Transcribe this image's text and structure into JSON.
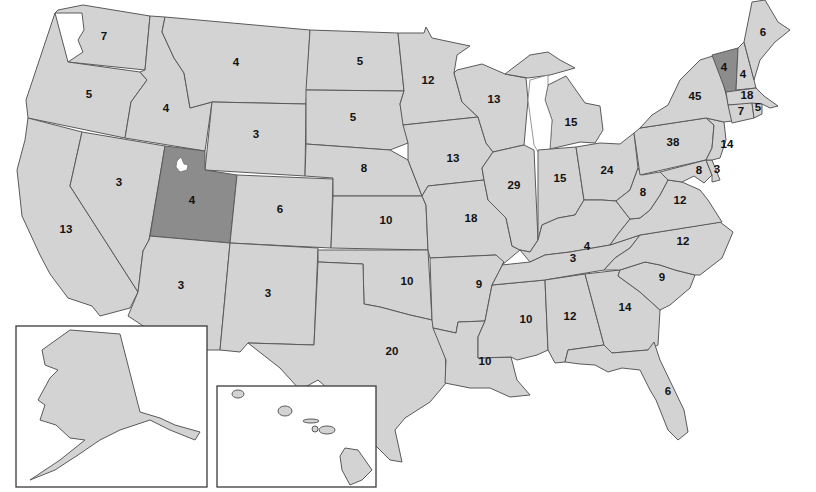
{
  "map": {
    "title": "United States map with state values",
    "colors": {
      "state_fill": "#d3d3d3",
      "highlight_fill": "#8c8c8c",
      "border": "#5a5a5a",
      "background": "#ffffff",
      "label": "#111111"
    },
    "highlighted_states": [
      "Utah",
      "Vermont"
    ],
    "states": [
      {
        "id": "WA",
        "name": "Washington",
        "value": "7",
        "x": 104,
        "y": 37
      },
      {
        "id": "OR",
        "name": "Oregon",
        "value": "5",
        "x": 89,
        "y": 95
      },
      {
        "id": "CA",
        "name": "California",
        "value": "13",
        "x": 66,
        "y": 230
      },
      {
        "id": "ID",
        "name": "Idaho",
        "value": "4",
        "x": 166,
        "y": 109
      },
      {
        "id": "NV",
        "name": "Nevada",
        "value": "3",
        "x": 119,
        "y": 183
      },
      {
        "id": "MT",
        "name": "Montana",
        "value": "4",
        "x": 236,
        "y": 63
      },
      {
        "id": "WY",
        "name": "Wyoming",
        "value": "3",
        "x": 256,
        "y": 135
      },
      {
        "id": "UT",
        "name": "Utah",
        "value": "4",
        "x": 192,
        "y": 201
      },
      {
        "id": "CO",
        "name": "Colorado",
        "value": "6",
        "x": 280,
        "y": 210
      },
      {
        "id": "AZ",
        "name": "Arizona",
        "value": "3",
        "x": 181,
        "y": 286
      },
      {
        "id": "NM",
        "name": "New Mexico",
        "value": "3",
        "x": 268,
        "y": 294
      },
      {
        "id": "ND",
        "name": "North Dakota",
        "value": "5",
        "x": 360,
        "y": 62
      },
      {
        "id": "SD",
        "name": "South Dakota",
        "value": "5",
        "x": 353,
        "y": 118
      },
      {
        "id": "NE",
        "name": "Nebraska",
        "value": "8",
        "x": 364,
        "y": 169
      },
      {
        "id": "KS",
        "name": "Kansas",
        "value": "10",
        "x": 386,
        "y": 221
      },
      {
        "id": "OK",
        "name": "Oklahoma",
        "value": "10",
        "x": 407,
        "y": 282
      },
      {
        "id": "TX",
        "name": "Texas",
        "value": "20",
        "x": 392,
        "y": 352
      },
      {
        "id": "MN",
        "name": "Minnesota",
        "value": "12",
        "x": 428,
        "y": 81
      },
      {
        "id": "IA",
        "name": "Iowa",
        "value": "13",
        "x": 453,
        "y": 159
      },
      {
        "id": "MO",
        "name": "Missouri",
        "value": "18",
        "x": 471,
        "y": 219
      },
      {
        "id": "AR",
        "name": "Arkansas",
        "value": "9",
        "x": 479,
        "y": 285
      },
      {
        "id": "LA",
        "name": "Louisiana",
        "value": "10",
        "x": 485,
        "y": 362
      },
      {
        "id": "WI",
        "name": "Wisconsin",
        "value": "13",
        "x": 494,
        "y": 100
      },
      {
        "id": "IL",
        "name": "Illinois",
        "value": "29",
        "x": 514,
        "y": 186
      },
      {
        "id": "MS",
        "name": "Mississippi",
        "value": "10",
        "x": 526,
        "y": 320
      },
      {
        "id": "MI",
        "name": "Michigan",
        "value": "15",
        "x": 571,
        "y": 123
      },
      {
        "id": "IN",
        "name": "Indiana",
        "value": "15",
        "x": 560,
        "y": 179
      },
      {
        "id": "KY",
        "name": "Kentucky",
        "value": "4",
        "x": 587,
        "y": 247
      },
      {
        "id": "TN",
        "name": "Tennessee",
        "value": "3",
        "x": 573,
        "y": 259
      },
      {
        "id": "AL",
        "name": "Alabama",
        "value": "12",
        "x": 570,
        "y": 317
      },
      {
        "id": "OH",
        "name": "Ohio",
        "value": "24",
        "x": 607,
        "y": 171
      },
      {
        "id": "GA",
        "name": "Georgia",
        "value": "14",
        "x": 625,
        "y": 308
      },
      {
        "id": "FL",
        "name": "Florida",
        "value": "6",
        "x": 668,
        "y": 392
      },
      {
        "id": "WV",
        "name": "West Virginia",
        "value": "8",
        "x": 643,
        "y": 193
      },
      {
        "id": "VA",
        "name": "Virginia",
        "value": "12",
        "x": 680,
        "y": 201
      },
      {
        "id": "NC",
        "name": "North Carolina",
        "value": "12",
        "x": 683,
        "y": 242
      },
      {
        "id": "SC",
        "name": "South Carolina",
        "value": "9",
        "x": 662,
        "y": 278
      },
      {
        "id": "PA",
        "name": "Pennsylvania",
        "value": "38",
        "x": 673,
        "y": 143
      },
      {
        "id": "NY",
        "name": "New York",
        "value": "45",
        "x": 695,
        "y": 97
      },
      {
        "id": "MD",
        "name": "Maryland",
        "value": "8",
        "x": 699,
        "y": 171
      },
      {
        "id": "DE",
        "name": "Delaware",
        "value": "3",
        "x": 717,
        "y": 170
      },
      {
        "id": "NJ",
        "name": "New Jersey",
        "value": "14",
        "x": 727,
        "y": 145
      },
      {
        "id": "VT",
        "name": "Vermont",
        "value": "4",
        "x": 724,
        "y": 68
      },
      {
        "id": "NH",
        "name": "New Hampshire",
        "value": "4",
        "x": 743,
        "y": 75
      },
      {
        "id": "MA",
        "name": "Massachusetts",
        "value": "18",
        "x": 747,
        "y": 96
      },
      {
        "id": "CT",
        "name": "Connecticut",
        "value": "7",
        "x": 741,
        "y": 112
      },
      {
        "id": "RI",
        "name": "Rhode Island",
        "value": "5",
        "x": 758,
        "y": 108
      },
      {
        "id": "ME",
        "name": "Maine",
        "value": "6",
        "x": 763,
        "y": 33
      }
    ],
    "insets": [
      {
        "id": "AK",
        "name": "Alaska",
        "value": ""
      },
      {
        "id": "HI",
        "name": "Hawaii",
        "value": ""
      }
    ]
  }
}
